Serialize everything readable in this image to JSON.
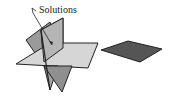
{
  "figure": {
    "label": "Solutions",
    "colors": {
      "light_plane": "#cfcfcf",
      "mid_plane": "#a9a9a9",
      "dark_plane": "#8f8f8f",
      "separate_plane": "#555555",
      "edge": "#222222"
    }
  }
}
